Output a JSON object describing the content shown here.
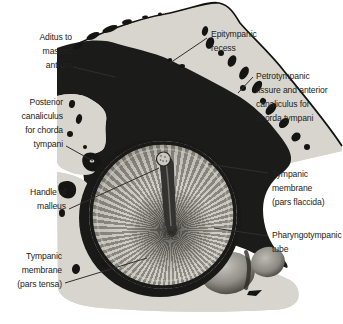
{
  "labels": {
    "aditus": "Aditus to\nmastoid\nantrum",
    "epitympanic_recess": "Epitympanic\nrecess",
    "petrotympanic": "Petrotympanic\nfissure and anterior\ncanaliculus for\nchorda tympani",
    "posterior_canaliculus": "Posterior\ncanaliculus\nfor chorda\ntympani",
    "handle_of_malleus": "Handle of\nmalleus",
    "pars_tensa": "Tympanic\nmembrane\n(pars tensa)",
    "pars_flaccida": "Tympanic\nmembrane\n(pars flaccida)",
    "pharyngotympanic_tube": "Pharyngotympanic\ntube"
  },
  "colors": {
    "background": "#ffffff",
    "bone": "#d7d5cd",
    "cavity": "#1b1b19",
    "membrane_light": "#d4d2ca",
    "membrane_dark": "#8b897f",
    "label_text": "#232321",
    "leader_line": "#2f2f2d"
  }
}
